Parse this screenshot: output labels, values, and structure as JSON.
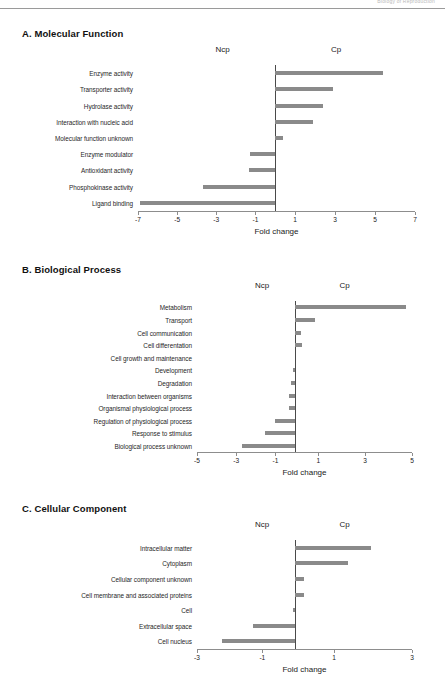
{
  "running_head": {
    "text": "Biology of Reproduction"
  },
  "axis_title": "Fold change",
  "group_labels": {
    "left": "Ncp",
    "right": "Cp"
  },
  "bar_color": "#8a8a8a",
  "axis_color": "#8d8d8d",
  "panels": [
    {
      "id": "A",
      "title": "A. Molecular Function"
    },
    {
      "id": "B",
      "title": "B. Biological Process"
    },
    {
      "id": "C",
      "title": "C. Cellular Component"
    }
  ],
  "chart_data": [
    {
      "type": "bar",
      "orientation": "horizontal",
      "title": "A. Molecular Function",
      "xlabel": "Fold change",
      "ylabel": "",
      "xlim": [
        -7,
        7
      ],
      "xticks": [
        -7,
        -5,
        -3,
        -1,
        1,
        3,
        5,
        7
      ],
      "xticklabels": [
        "-7",
        "-5",
        "-3",
        "-1",
        "1",
        "3",
        "5",
        "7"
      ],
      "grid": false,
      "legend": [
        "Ncp",
        "Cp"
      ],
      "legend_position": "top",
      "categories": [
        "Enzyme activity",
        "Transporter activity",
        "Hydrolase activity",
        "Interaction with nucleic acid",
        "Molecular function unknown",
        "Enzyme modulator",
        "Antioxidant activity",
        "Phosphokinase activity",
        "Ligand binding"
      ],
      "values": [
        5.4,
        2.9,
        2.4,
        1.9,
        0.4,
        -1.3,
        -1.35,
        -3.7,
        -6.9
      ]
    },
    {
      "type": "bar",
      "orientation": "horizontal",
      "title": "B. Biological Process",
      "xlabel": "Fold change",
      "ylabel": "",
      "xlim": [
        -5,
        5
      ],
      "xticks": [
        -5,
        -3,
        -1,
        1,
        3,
        5
      ],
      "xticklabels": [
        "-5",
        "-3",
        "-1",
        "1",
        "3",
        "5"
      ],
      "grid": false,
      "legend": [
        "Ncp",
        "Cp"
      ],
      "legend_position": "top",
      "categories": [
        "Metabolism",
        "Transport",
        "Cell communication",
        "Cell differentation",
        "Cell growth and maintenance",
        "Development",
        "Degradation",
        "Interaction between organisms",
        "Organismal physiological process",
        "Regulation of physiological process",
        "Response to stimulus",
        "Biological process unknown"
      ],
      "values": [
        4.75,
        0.85,
        0.25,
        0.3,
        0.0,
        -0.08,
        -0.22,
        -0.3,
        -0.32,
        -1.0,
        -1.55,
        -2.7
      ]
    },
    {
      "type": "bar",
      "orientation": "horizontal",
      "title": "C. Cellular Component",
      "xlabel": "Fold change",
      "ylabel": "",
      "xlim": [
        -3,
        3
      ],
      "xticks": [
        -3,
        -1,
        1,
        3
      ],
      "xticklabels": [
        "-3",
        "-1",
        "1",
        "3"
      ],
      "grid": false,
      "legend": [
        "Ncp",
        "Cp"
      ],
      "legend_position": "top",
      "categories": [
        "Intracellular matter",
        "Cytoplasm",
        "Cellular component unknown",
        "Cell membrane and associated proteins",
        "Cell",
        "Extracellular space",
        "Cell nucleus"
      ],
      "values": [
        1.95,
        1.35,
        0.22,
        0.22,
        -0.05,
        -1.3,
        -2.25
      ]
    }
  ]
}
